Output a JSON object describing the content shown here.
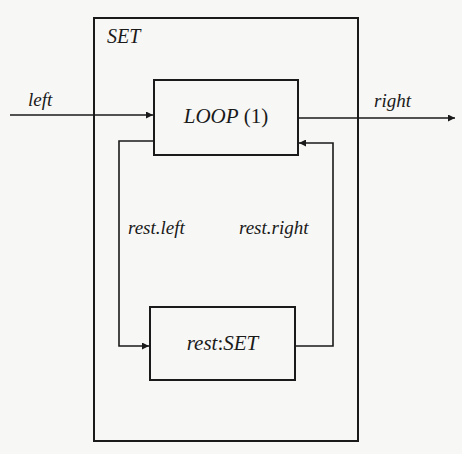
{
  "diagram": {
    "top_cut_text": ", ",
    "outer_box": {
      "label": "SET"
    },
    "loop_box": {
      "name_italic": "LOOP",
      "index": "(1)"
    },
    "rest_box": {
      "label_prefix": "rest",
      "label_sep": ":",
      "label_type": "SET"
    },
    "edges": {
      "input_label": "left",
      "output_label": "right",
      "rest_left_label": "rest.left",
      "rest_right_label": "rest.right"
    },
    "colors": {
      "line": "#1a1a1a",
      "background": "#f7f7f5"
    }
  }
}
